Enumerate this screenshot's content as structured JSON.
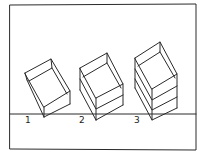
{
  "figure": {
    "title": "",
    "stroke_color": "#2a2a2a",
    "background": "#ffffff"
  },
  "boxes": [
    {
      "label": "1",
      "tiers": 1
    },
    {
      "label": "2",
      "tiers": 2
    },
    {
      "label": "3",
      "tiers": 3
    }
  ]
}
